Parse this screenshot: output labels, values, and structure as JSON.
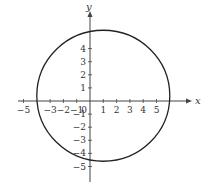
{
  "chart_data": {
    "type": "line",
    "title": "",
    "xlabel": "x",
    "ylabel": "y",
    "xlim": [
      -5.5,
      6.5
    ],
    "ylim": [
      -5.6,
      5.9
    ],
    "grid": false,
    "x_ticks": [
      -5,
      -3,
      -2,
      -1,
      0,
      1,
      2,
      3,
      4,
      5
    ],
    "x_tick_labels": [
      "−5",
      "−3",
      "−2",
      "−1",
      "0",
      "1",
      "2",
      "3",
      "4",
      "5"
    ],
    "y_ticks": [
      4,
      3,
      2,
      1,
      -1,
      -2,
      -3,
      -4,
      -5
    ],
    "y_tick_labels": [
      "4",
      "3",
      "2",
      "1",
      "−1",
      "−2",
      "−3",
      "−4",
      "−5"
    ],
    "series": [
      {
        "name": "circle",
        "shape": "circle",
        "center": [
          1,
          0.4
        ],
        "radius": 5,
        "color": "#222222"
      }
    ]
  }
}
